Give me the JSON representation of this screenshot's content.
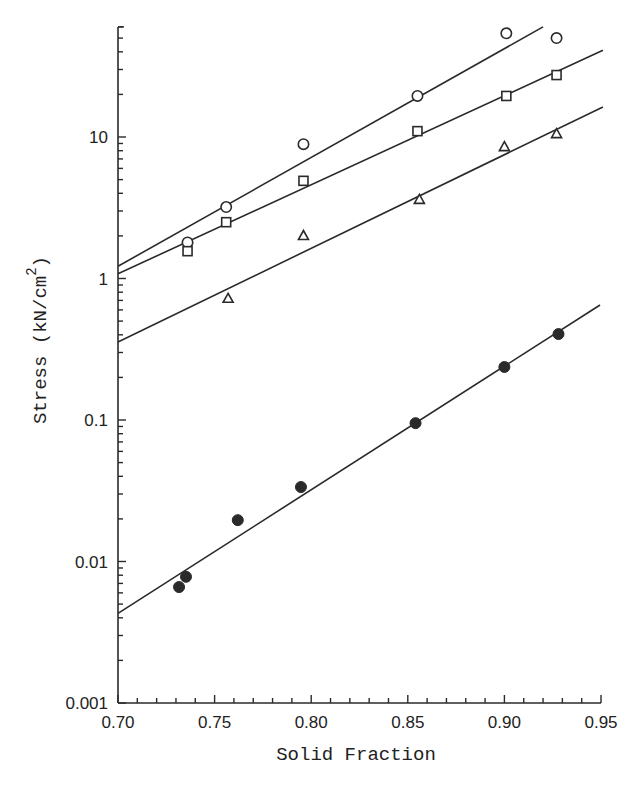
{
  "chart_data": {
    "type": "scatter",
    "title": "",
    "xlabel": "Solid Fraction",
    "ylabel": "Stress (kN/cm",
    "ylabel_superscript": "2",
    "ylabel_suffix": ")",
    "xlim": [
      0.7,
      0.95
    ],
    "ylim": [
      0.001,
      60
    ],
    "yscale": "log",
    "grid": false,
    "legend": "none",
    "x_ticks": [
      "0.70",
      "0.75",
      "0.80",
      "0.85",
      "0.90",
      "0.95"
    ],
    "x_tick_values": [
      0.7,
      0.75,
      0.8,
      0.85,
      0.9,
      0.95
    ],
    "x_minor_step": 0.01,
    "y_ticks": [
      "0.001",
      "0.01",
      "0.1",
      "1",
      "10"
    ],
    "y_tick_values": [
      0.001,
      0.01,
      0.1,
      1,
      10
    ],
    "series": [
      {
        "name": "open circles",
        "marker": "circle-open",
        "x": [
          0.736,
          0.756,
          0.796,
          0.855,
          0.901,
          0.927
        ],
        "y": [
          1.8,
          3.2,
          8.9,
          19.5,
          54,
          50
        ],
        "fit_line": {
          "x": [
            0.7,
            0.92
          ],
          "y": [
            1.22,
            60
          ]
        }
      },
      {
        "name": "open squares",
        "marker": "square-open",
        "x": [
          0.736,
          0.756,
          0.796,
          0.855,
          0.901,
          0.927
        ],
        "y": [
          1.56,
          2.5,
          4.9,
          11.0,
          19.5,
          27.4
        ],
        "fit_line": {
          "x": [
            0.7,
            0.951
          ],
          "y": [
            1.08,
            41
          ]
        }
      },
      {
        "name": "open triangles",
        "marker": "triangle-open",
        "x": [
          0.757,
          0.796,
          0.856,
          0.9,
          0.927
        ],
        "y": [
          0.72,
          2.0,
          3.6,
          8.5,
          10.5
        ],
        "fit_line": {
          "x": [
            0.7,
            0.951
          ],
          "y": [
            0.356,
            16.3
          ]
        }
      },
      {
        "name": "filled circles",
        "marker": "circle-filled",
        "x": [
          0.7316,
          0.7352,
          0.762,
          0.7947,
          0.854,
          0.9,
          0.928
        ],
        "y": [
          0.0066,
          0.0078,
          0.0196,
          0.0336,
          0.095,
          0.237,
          0.405
        ],
        "fit_line": {
          "x": [
            0.7,
            0.9495
          ],
          "y": [
            0.0043,
            0.65
          ]
        }
      }
    ]
  }
}
